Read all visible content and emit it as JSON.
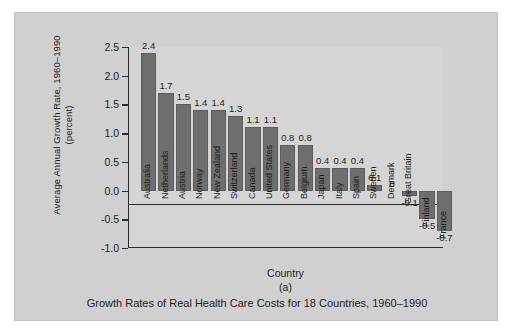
{
  "chart_data": {
    "type": "bar",
    "title": "",
    "caption": "Growth Rates of Real Health Care Costs for 18 Countries, 1960–1990",
    "panel_letter": "(a)",
    "xlabel": "Country",
    "ylabel": "Average Annual Growth Rate, 1960–1990 (percent)",
    "ylabel_line1": "Average Annual Growth Rate, 1960–1990",
    "ylabel_line2": "(percent)",
    "ylim": [
      -1.0,
      2.5
    ],
    "yticks": [
      2.5,
      2.0,
      1.5,
      1.0,
      0.5,
      0.0,
      -0.5,
      -1.0
    ],
    "ytick_labels": [
      "2.5",
      "2.0",
      "1.5",
      "1.0",
      "0.5",
      "0.0",
      "-0.5",
      "-1.0"
    ],
    "grid": false,
    "legend": "none",
    "bar_color": "#6e6e6e",
    "categories": [
      "Australia",
      "Netherlands",
      "Austria",
      "Norway",
      "New Zealand",
      "Switzerland",
      "Canada",
      "United States",
      "Germany",
      "Belgium",
      "Japan",
      "Italy",
      "Spain",
      "Sweden",
      "Denmark",
      "Great Britain",
      "Finland",
      "France"
    ],
    "values": [
      2.4,
      1.7,
      1.5,
      1.4,
      1.4,
      1.3,
      1.1,
      1.1,
      0.8,
      0.8,
      0.4,
      0.4,
      0.4,
      0.1,
      0,
      -0.1,
      -0.5,
      -0.7
    ],
    "value_labels": [
      "2.4",
      "1.7",
      "1.5",
      "1.4",
      "1.4",
      "1.3",
      "1.1",
      "1.1",
      "0.8",
      "0.8",
      "0.4",
      "0.4",
      "0.4",
      "0.1",
      "0",
      "-0.1",
      "-0.5",
      "-0.7"
    ]
  }
}
